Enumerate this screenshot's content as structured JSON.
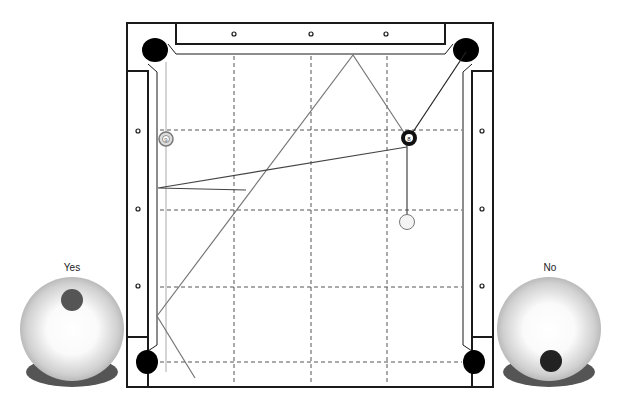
{
  "diagram": {
    "labels": {
      "left_ball": "Yes",
      "right_ball": "No"
    },
    "balls": [
      {
        "id": "nine-ball",
        "number": "9",
        "x": 166,
        "y": 139,
        "style": "ghost"
      },
      {
        "id": "eight-ball",
        "number": "8",
        "x": 409,
        "y": 138,
        "style": "black"
      },
      {
        "id": "cue-ball",
        "number": "",
        "x": 407,
        "y": 222,
        "style": "white"
      }
    ],
    "cue_hit_examples": [
      {
        "label": "Yes",
        "tip_position": "high"
      },
      {
        "label": "No",
        "tip_position": "low"
      }
    ],
    "colors": {
      "outline": "#1a1a1a",
      "path_line": "#666666",
      "grid_line": "#555555",
      "pocket": "#000000",
      "shadow": "#555555",
      "tip_dot_yes": "#555555",
      "tip_dot_no": "#222222"
    }
  }
}
